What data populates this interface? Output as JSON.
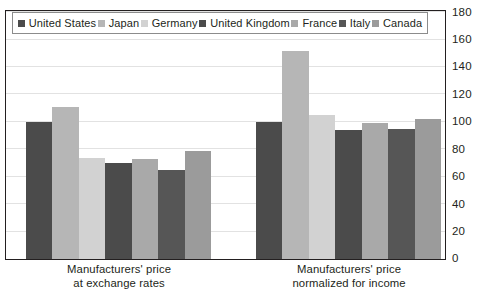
{
  "chart_data": {
    "type": "bar",
    "title": "",
    "subtitle": "",
    "xlabel": "",
    "ylabel": "",
    "ylim": [
      0,
      180
    ],
    "yticks": [
      0,
      20,
      40,
      60,
      80,
      100,
      120,
      140,
      160,
      180
    ],
    "ytick_labels": [
      "0",
      "20",
      "40",
      "60",
      "80",
      "100",
      "120",
      "140",
      "160",
      "180"
    ],
    "y_axis_position": "right",
    "grid": true,
    "grid_axis": "y",
    "legend_position": "top-inside",
    "grouped": true,
    "bar_gap_within_group": 0,
    "categories": [
      "Manufacturers' price\nat exchange rates",
      "Manufacturers' price\nnormalized for income"
    ],
    "category_labels": [
      {
        "line1": "Manufacturers' price",
        "line2": "at exchange rates"
      },
      {
        "line1": "Manufacturers' price",
        "line2": "normalized for income"
      }
    ],
    "series": [
      {
        "name": "United States",
        "color": "#4b4b4b",
        "values": [
          100,
          100
        ]
      },
      {
        "name": "Japan",
        "color": "#b6b6b6",
        "values": [
          111,
          152
        ]
      },
      {
        "name": "Germany",
        "color": "#d2d2d2",
        "values": [
          74,
          105
        ]
      },
      {
        "name": "United Kingdom",
        "color": "#4b4b4b",
        "values": [
          70,
          94
        ]
      },
      {
        "name": "France",
        "color": "#a9a9a9",
        "values": [
          73,
          99
        ]
      },
      {
        "name": "Italy",
        "color": "#565656",
        "values": [
          65,
          95
        ]
      },
      {
        "name": "Canada",
        "color": "#9b9b9b",
        "values": [
          79,
          102
        ]
      }
    ]
  },
  "legend": {
    "items": [
      {
        "label": "United States",
        "swatch_color": "#4b4b4b"
      },
      {
        "label": "Japan",
        "swatch_color": "#b6b6b6"
      },
      {
        "label": "Germany",
        "swatch_color": "#d2d2d2"
      },
      {
        "label": "United Kingdom",
        "swatch_color": "#4b4b4b"
      },
      {
        "label": "France",
        "swatch_color": "#a9a9a9"
      },
      {
        "label": "Italy",
        "swatch_color": "#565656"
      },
      {
        "label": "Canada",
        "swatch_color": "#9b9b9b"
      }
    ]
  },
  "style": {
    "frame_color": "#231f20",
    "grid_color": "#e2e2e2",
    "text_color": "#231f20",
    "background": "#ffffff"
  }
}
